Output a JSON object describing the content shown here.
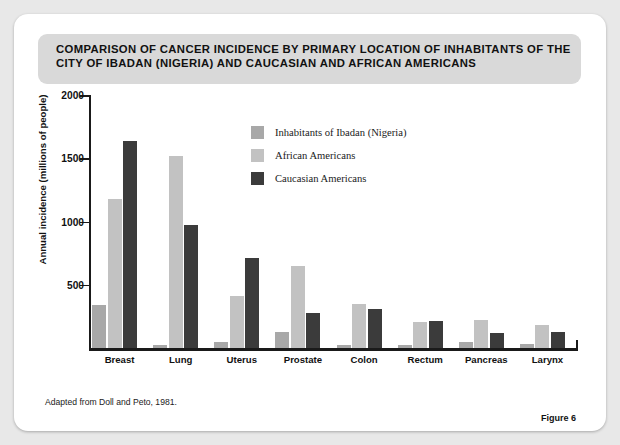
{
  "title": "COMPARISON OF CANCER INCIDENCE BY PRIMARY LOCATION OF INHABITANTS OF THE CITY OF IBADAN (NIGERIA) AND CAUCASIAN AND AFRICAN AMERICANS",
  "source_note": "Adapted from Doll and Peto, 1981.",
  "figure_label": "Figure 6",
  "colors": {
    "series_ibadan": "#a8a8a8",
    "series_african_american": "#c2c2c2",
    "series_caucasian_american": "#3b3b3b",
    "axis": "#1a1a1a",
    "card_background": "#ffffff",
    "page_background": "#e8e8e8",
    "title_banner": "#d9d9d9"
  },
  "chart_data": {
    "type": "bar",
    "title": "COMPARISON OF CANCER INCIDENCE BY PRIMARY LOCATION OF INHABITANTS OF THE CITY OF IBADAN (NIGERIA) AND CAUCASIAN AND AFRICAN AMERICANS",
    "xlabel": "",
    "ylabel": "Annual incidence (millions of people)",
    "ylim": [
      0,
      2000
    ],
    "yticks": [
      0,
      500,
      1000,
      1500,
      2000
    ],
    "ytick_labels": [
      "",
      "500",
      "1000",
      "1500",
      "2000"
    ],
    "grid": false,
    "legend_position": "inside-top-center",
    "categories": [
      "Breast",
      "Lung",
      "Uterus",
      "Prostate",
      "Colon",
      "Rectum",
      "Pancreas",
      "Larynx"
    ],
    "series": [
      {
        "name": "Inhabitants of Ibadan (Nigeria)",
        "color": "#a8a8a8",
        "values": [
          340,
          20,
          50,
          130,
          25,
          20,
          50,
          30
        ]
      },
      {
        "name": "African Americans",
        "color": "#c2c2c2",
        "values": [
          1180,
          1520,
          410,
          650,
          345,
          205,
          225,
          185
        ]
      },
      {
        "name": "Caucasian Americans",
        "color": "#3b3b3b",
        "values": [
          1640,
          975,
          710,
          275,
          310,
          215,
          115,
          130
        ]
      }
    ]
  }
}
